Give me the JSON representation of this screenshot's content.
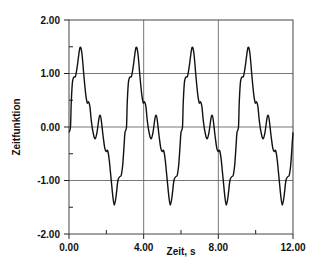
{
  "chart_data": {
    "type": "line",
    "title": "",
    "xlabel": "Zeit, s",
    "ylabel": "Zeitfunktion",
    "xlim": [
      0,
      12
    ],
    "ylim": [
      -2,
      2
    ],
    "x_ticks": [
      0,
      4,
      8,
      12
    ],
    "x_tick_labels": [
      "0.00",
      "4.00",
      "8.00",
      "12.00"
    ],
    "x_minor_ticks": [
      2,
      6,
      10
    ],
    "y_ticks": [
      2,
      1,
      0,
      -1,
      -2
    ],
    "y_tick_labels": [
      "2.00",
      "1.00",
      "0.00",
      "-1.00",
      "-2.00"
    ],
    "y_minor_ticks": [
      1.5,
      0.5,
      -0.5,
      -1.5
    ],
    "grid": true,
    "grid_x": [
      4,
      8
    ],
    "grid_y": [
      1,
      0,
      -1
    ],
    "legend": null,
    "series": [
      {
        "name": "Zeitfunktion",
        "color": "#111111",
        "period": 3,
        "cycles": 4,
        "one_period": {
          "t": [
            0.0,
            0.08,
            0.12,
            0.18,
            0.25,
            0.35,
            0.45,
            0.55,
            0.62,
            0.7,
            0.8,
            0.9,
            0.98,
            1.05,
            1.12,
            1.2,
            1.3,
            1.4,
            1.5,
            1.6,
            1.66,
            1.72,
            1.82,
            1.92,
            2.0,
            2.07,
            2.15,
            2.25,
            2.35,
            2.43,
            2.52,
            2.62,
            2.72,
            2.8,
            2.88,
            2.95,
            3.0
          ],
          "y": [
            -0.1,
            0.0,
            0.45,
            0.82,
            0.93,
            0.95,
            1.15,
            1.42,
            1.49,
            1.35,
            0.95,
            0.6,
            0.45,
            0.47,
            0.38,
            0.1,
            -0.12,
            -0.22,
            -0.1,
            0.15,
            0.22,
            0.15,
            -0.15,
            -0.4,
            -0.46,
            -0.44,
            -0.6,
            -0.95,
            -1.3,
            -1.46,
            -1.3,
            -1.0,
            -0.93,
            -0.9,
            -0.7,
            -0.35,
            -0.1
          ]
        }
      }
    ]
  },
  "layout": {
    "plot_left": 69,
    "plot_top": 20,
    "plot_right": 293,
    "plot_bottom": 234
  }
}
